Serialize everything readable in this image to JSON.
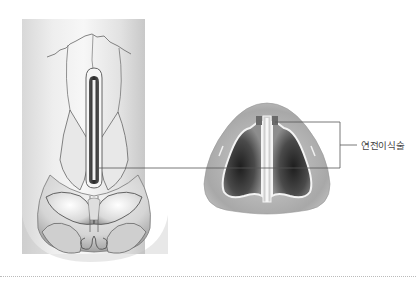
{
  "figure": {
    "left_panel": "nose-frontal-view-with-implant",
    "right_panel": "nose-base-cross-section-with-septal-extension",
    "callout_label": "연전이식술"
  },
  "footer": {
    "caption_cutoff": ""
  }
}
